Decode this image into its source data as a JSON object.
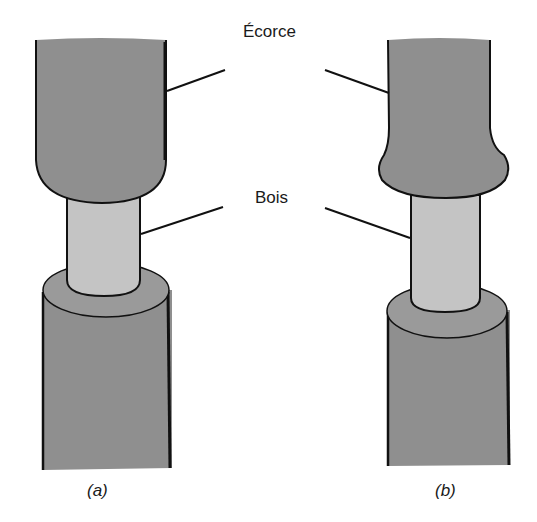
{
  "labels": {
    "bark": "Écorce",
    "wood": "Bois"
  },
  "captions": {
    "a": "(a)",
    "b": "(b)"
  },
  "colors": {
    "bark": "#8f8f8f",
    "wood": "#c4c4c4",
    "ring_top": "#9a9a9a",
    "outline": "#111111",
    "background": "#ffffff"
  }
}
